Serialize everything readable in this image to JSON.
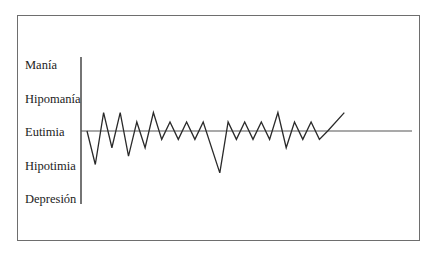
{
  "chart_data": {
    "type": "line",
    "title": "",
    "xlabel": "",
    "ylabel": "",
    "y_categories": [
      "Manía",
      "Hipomanía",
      "Eutimia",
      "Hipotimia",
      "Depresión"
    ],
    "y_values": [
      2,
      1,
      0,
      -1,
      -2
    ],
    "ylim": [
      -2,
      2
    ],
    "baseline": {
      "label": "Eutimia",
      "value": 0
    },
    "grid": false,
    "legend": "none",
    "series": [
      {
        "name": "estado de ánimo",
        "x": [
          0,
          1,
          2,
          3,
          4,
          5,
          6,
          7,
          8,
          9,
          10,
          11,
          12,
          13,
          14,
          16,
          17,
          18,
          19,
          20,
          21,
          22,
          23,
          24,
          25,
          26,
          27,
          28,
          29,
          31
        ],
        "values": [
          0,
          -1,
          0.55,
          -0.5,
          0.55,
          -0.75,
          0.27,
          -0.5,
          0.55,
          -0.25,
          0.27,
          -0.25,
          0.27,
          -0.25,
          0.27,
          -1.25,
          0.27,
          -0.25,
          0.27,
          -0.25,
          0.27,
          -0.25,
          0.55,
          -0.5,
          0.27,
          -0.25,
          0.27,
          -0.25,
          0,
          0.55
        ]
      }
    ]
  },
  "colors": {
    "line": "#2a2a2a",
    "frame": "#6e6e6e",
    "text": "#222222"
  }
}
